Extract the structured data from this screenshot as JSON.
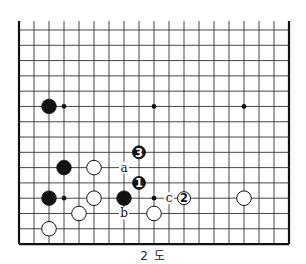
{
  "diagram": {
    "caption": "2 도",
    "board": {
      "columns": 19,
      "rows_shown": 15,
      "origin_x": 19,
      "origin_y": 30,
      "cell_w": 15,
      "cell_h": 15.29,
      "top_edge_cut": true,
      "line_color": "#333333",
      "edge_color": "#111111"
    },
    "hoshi": [
      {
        "col": 3,
        "row": 5
      },
      {
        "col": 9,
        "row": 5
      },
      {
        "col": 15,
        "row": 5
      },
      {
        "col": 3,
        "row": 11
      },
      {
        "col": 9,
        "row": 11
      }
    ],
    "stones": [
      {
        "color": "black",
        "col": 2,
        "row": 5,
        "label": ""
      },
      {
        "color": "black",
        "col": 3,
        "row": 9,
        "label": ""
      },
      {
        "color": "black",
        "col": 2,
        "row": 11,
        "label": ""
      },
      {
        "color": "black",
        "col": 7,
        "row": 11,
        "label": ""
      },
      {
        "color": "white",
        "col": 5,
        "row": 9,
        "label": ""
      },
      {
        "color": "white",
        "col": 5,
        "row": 11,
        "label": ""
      },
      {
        "color": "white",
        "col": 4,
        "row": 12,
        "label": ""
      },
      {
        "color": "white",
        "col": 2,
        "row": 13,
        "label": ""
      },
      {
        "color": "white",
        "col": 9,
        "row": 12,
        "label": ""
      },
      {
        "color": "white",
        "col": 15,
        "row": 11,
        "label": ""
      },
      {
        "color": "black",
        "col": 8,
        "row": 10,
        "label": "1"
      },
      {
        "color": "white",
        "col": 11,
        "row": 11,
        "label": "2"
      },
      {
        "color": "black",
        "col": 8,
        "row": 8,
        "label": "3"
      }
    ],
    "markers": [
      {
        "text": "a",
        "col": 7,
        "row": 9
      },
      {
        "text": "b",
        "col": 7,
        "row": 12
      },
      {
        "text": "c",
        "col": 10,
        "row": 11
      }
    ]
  }
}
